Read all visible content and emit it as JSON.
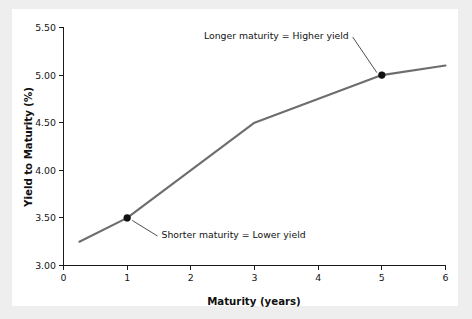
{
  "figure": {
    "panel_background": "#ffffff",
    "outer_background": "#eeeeee"
  },
  "chart_data": {
    "type": "line",
    "title": "",
    "subtitle": "",
    "xlabel": "Maturity (years)",
    "ylabel": "Yield to Maturity (%)",
    "xlim": [
      0,
      6
    ],
    "ylim": [
      3.0,
      5.5
    ],
    "xticks": [
      0,
      1,
      2,
      3,
      4,
      5,
      6
    ],
    "xtick_labels": [
      "0",
      "1",
      "2",
      "3",
      "4",
      "5",
      "6"
    ],
    "yticks": [
      3.0,
      3.5,
      4.0,
      4.5,
      5.0,
      5.5
    ],
    "ytick_labels": [
      "3.00",
      "3.50",
      "4.00",
      "4.50",
      "5.00",
      "5.50"
    ],
    "grid": false,
    "legend": false,
    "legend_position": "none",
    "line_color": "#6d6d6d",
    "marker_color": "#111111",
    "series": [
      {
        "name": "Yield curve",
        "x": [
          0.25,
          1.0,
          3.0,
          5.0,
          6.0
        ],
        "y": [
          3.25,
          3.5,
          4.5,
          5.0,
          5.1
        ]
      }
    ],
    "markers": [
      {
        "label": "1-year point",
        "x": 1.0,
        "y": 3.5
      },
      {
        "label": "5-year point",
        "x": 5.0,
        "y": 5.0
      }
    ],
    "annotations": [
      {
        "text": "Longer maturity = Higher yield",
        "text_x": 4.48,
        "text_y": 5.41,
        "point_x": 5.0,
        "point_y": 5.0,
        "align": "right"
      },
      {
        "text": "Shorter maturity = Lower yield",
        "text_x": 1.54,
        "text_y": 3.32,
        "point_x": 1.0,
        "point_y": 3.5,
        "align": "left"
      }
    ]
  }
}
